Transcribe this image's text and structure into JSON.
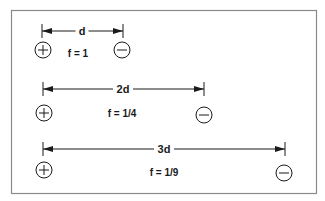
{
  "diagram": {
    "frame": {
      "x": 11,
      "y": 10,
      "width": 305,
      "height": 183,
      "stroke": "#8a8a8a"
    },
    "colors": {
      "ink": "#1a1a1a",
      "frame": "#8a8a8a",
      "background": "#ffffff"
    },
    "rows": [
      {
        "distance_label": "d",
        "force_label": "f = 1",
        "dim": {
          "x1": 42,
          "x2": 123,
          "y": 31,
          "label_x": 82
        },
        "positive_charge": {
          "symbol": "+",
          "cx": 43,
          "cy": 50
        },
        "negative_charge": {
          "symbol": "−",
          "cx": 122,
          "cy": 50
        },
        "force_pos": {
          "x": 78,
          "y": 57
        }
      },
      {
        "distance_label": "2d",
        "force_label": "f = 1/4",
        "dim": {
          "x1": 43,
          "x2": 204,
          "y": 89,
          "label_x": 123
        },
        "positive_charge": {
          "symbol": "+",
          "cx": 44,
          "cy": 113
        },
        "negative_charge": {
          "symbol": "−",
          "cx": 204,
          "cy": 115
        },
        "force_pos": {
          "x": 122,
          "y": 117
        }
      },
      {
        "distance_label": "3d",
        "force_label": "f = 1/9",
        "dim": {
          "x1": 43,
          "x2": 285,
          "y": 149,
          "label_x": 164
        },
        "positive_charge": {
          "symbol": "+",
          "cx": 44,
          "cy": 170
        },
        "negative_charge": {
          "symbol": "−",
          "cx": 284,
          "cy": 173
        },
        "force_pos": {
          "x": 164,
          "y": 176
        }
      }
    ]
  }
}
